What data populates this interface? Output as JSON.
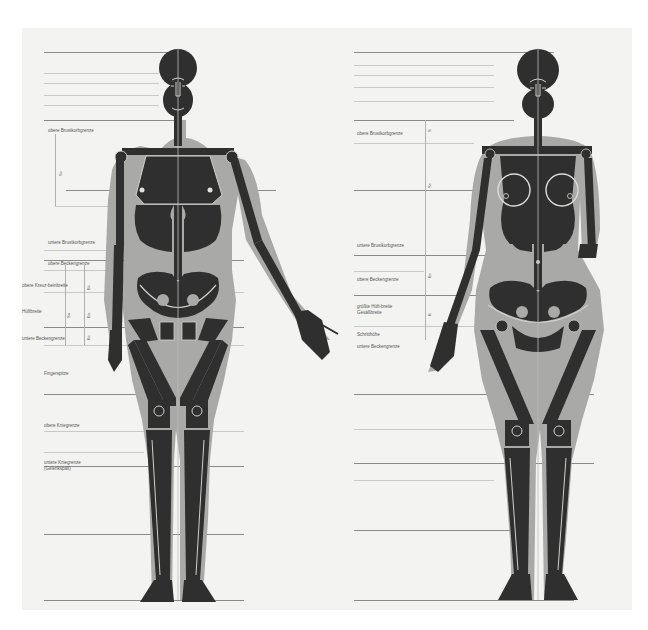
{
  "diagram": {
    "title": "",
    "colors": {
      "paper": "#f3f3f1",
      "silhouette": "#a9a9a7",
      "bone": "#2f2f2f",
      "bone_outline": "#d9d9d7",
      "guide_line": "#8a8a8a"
    },
    "figures": [
      {
        "id": "male",
        "labels": [
          {
            "text": "obere Brustkorbgrenze",
            "y": 130
          },
          {
            "text": "untere Brustkorbgrenze",
            "y": 242
          },
          {
            "text": "obere Beckengrenze",
            "y": 263
          },
          {
            "text": "obere Kreuz-beinbreite",
            "y": 285
          },
          {
            "text": "Hüftbreite",
            "y": 311
          },
          {
            "text": "untere Beckengrenze",
            "y": 338
          },
          {
            "text": "Fingerspitze",
            "y": 373
          },
          {
            "text": "obere Kniegrenze",
            "y": 425
          },
          {
            "text": "untere Kniegrenze",
            "y": 462
          },
          {
            "text": "(Gelenkspalt)",
            "y": 468
          }
        ],
        "measure_ticks": [
          "Ss",
          "Sa",
          "Bs",
          "Bn",
          "Bs"
        ]
      },
      {
        "id": "female",
        "labels": [
          {
            "text": "obere Brustkorbgrenze",
            "y": 133
          },
          {
            "text": "untere Brustkorbgrenze",
            "y": 245
          },
          {
            "text": "obere Beckengrenze",
            "y": 279
          },
          {
            "text": "größte Hüft-breite",
            "y": 306
          },
          {
            "text": "Gesäßbreite",
            "y": 312
          },
          {
            "text": "Schritthöhe",
            "y": 334
          },
          {
            "text": "untere Beckengrenze",
            "y": 346
          }
        ],
        "measure_ticks": [
          "S",
          "Ss",
          "Bs",
          "B"
        ]
      }
    ]
  }
}
